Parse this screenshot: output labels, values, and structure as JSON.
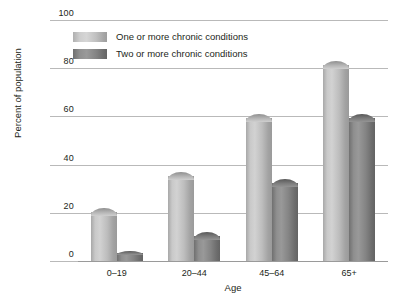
{
  "chart_data": {
    "type": "bar",
    "title": "",
    "subtitle": "",
    "xlabel": "Age",
    "ylabel": "Percent of population",
    "categories": [
      "0–19",
      "20–44",
      "45–64",
      "65+"
    ],
    "series": [
      {
        "name": "One or more chronic conditions",
        "color": "#c9c9c9",
        "values": [
          22,
          37,
          61,
          83
        ]
      },
      {
        "name": "Two or more chronic conditions",
        "color": "#8a8a8a",
        "values": [
          4,
          12,
          34,
          61
        ]
      }
    ],
    "ylim": [
      0,
      100
    ],
    "yticks": [
      0,
      20,
      40,
      60,
      80,
      100
    ],
    "ytick_labels": [
      "0",
      "20",
      "40",
      "60",
      "80",
      "100"
    ],
    "grid": true,
    "grid_axis": "y",
    "legend_position": "top-left-inside",
    "background_color": "#ffffff",
    "gridline_color": "#b9b9b9",
    "text_color": "#231f20"
  },
  "axes": {
    "y_title": "Percent of population",
    "x_title": "Age"
  }
}
